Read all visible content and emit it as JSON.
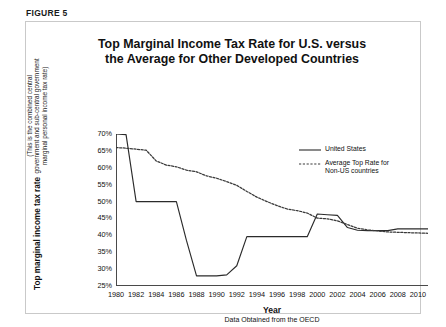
{
  "figure": {
    "label": "FIGURE 5"
  },
  "chart_data": {
    "type": "line",
    "title": "Top Marginal Income Tax Rate for U.S. versus the Average for Other Developed Countries",
    "title_line1": "Top Marginal Income Tax Rate for U.S. versus",
    "title_line2": "the Average for Other Developed Countries",
    "xlabel": "Year",
    "ylabel": "Top marginal income tax rate",
    "ylabel_sub": "(This is the combined central government and sub-central government marginal personal income tax rate)",
    "source_note": "Data Obtained from the OECD",
    "xlim": [
      1980,
      2011
    ],
    "ylim": [
      25,
      70
    ],
    "ytick_suffix": "%",
    "yticks": [
      25,
      30,
      35,
      40,
      45,
      50,
      55,
      60,
      65,
      70
    ],
    "ytick_labels": [
      "25%",
      "30%",
      "35%",
      "40%",
      "45%",
      "50%",
      "55%",
      "60%",
      "65%",
      "70%"
    ],
    "xticks": [
      1980,
      1982,
      1984,
      1986,
      1988,
      1990,
      1992,
      1994,
      1996,
      1998,
      2000,
      2002,
      2004,
      2006,
      2008,
      2010
    ],
    "xtick_labels": [
      "1980",
      "1982",
      "1984",
      "1986",
      "1988",
      "1990",
      "1992",
      "1994",
      "1996",
      "1998",
      "2000",
      "2002",
      "2004",
      "2006",
      "2008",
      "2010"
    ],
    "grid": false,
    "legend_position": "upper-right-inside",
    "x": [
      1980,
      1981,
      1982,
      1983,
      1984,
      1985,
      1986,
      1987,
      1988,
      1989,
      1990,
      1991,
      1992,
      1993,
      1994,
      1995,
      1996,
      1997,
      1998,
      1999,
      2000,
      2001,
      2002,
      2003,
      2004,
      2005,
      2006,
      2007,
      2008,
      2009,
      2010,
      2011
    ],
    "series": [
      {
        "name": "United States",
        "style": "solid",
        "color": "#2b2b2b",
        "values": [
          70.0,
          69.8,
          50.0,
          50.0,
          50.0,
          50.0,
          50.0,
          38.5,
          28.0,
          28.0,
          28.0,
          28.3,
          31.0,
          39.6,
          39.6,
          39.6,
          39.6,
          39.6,
          39.6,
          39.6,
          46.3,
          46.1,
          45.9,
          42.3,
          41.5,
          41.4,
          41.4,
          41.4,
          41.9,
          41.9,
          41.9,
          41.9
        ]
      },
      {
        "name": "Average Top Rate for Non-US countries",
        "style": "dashed",
        "color": "#3a3a3a",
        "values": [
          66.0,
          65.8,
          65.5,
          65.2,
          62.0,
          60.8,
          60.3,
          59.3,
          58.8,
          57.6,
          56.9,
          55.9,
          54.8,
          53.0,
          51.3,
          50.0,
          48.8,
          47.8,
          47.3,
          46.6,
          45.1,
          44.9,
          44.3,
          43.2,
          42.1,
          41.6,
          41.3,
          41.0,
          40.9,
          40.8,
          40.7,
          40.6
        ]
      }
    ]
  },
  "legend": {
    "items": [
      {
        "label": "United States",
        "style": "solid"
      },
      {
        "label": "Average Top Rate for Non-US countries",
        "label_line1": "Average Top Rate for",
        "label_line2": "Non-US countries",
        "style": "dashed"
      }
    ]
  }
}
